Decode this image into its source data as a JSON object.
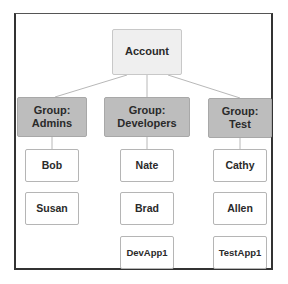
{
  "diagram": {
    "root": {
      "label": "Account"
    },
    "groups": [
      {
        "prefix": "Group:",
        "name": "Admins",
        "members": [
          "Bob",
          "Susan"
        ]
      },
      {
        "prefix": "Group:",
        "name": "Developers",
        "members": [
          "Nate",
          "Brad",
          "DevApp1"
        ]
      },
      {
        "prefix": "Group:",
        "name": "Test",
        "members": [
          "Cathy",
          "Allen",
          "TestApp1"
        ]
      }
    ],
    "colors": {
      "root_fill": "#efefef",
      "group_fill": "#bdbdbd",
      "member_fill": "#ffffff",
      "connector": "#b8b8b8",
      "frame": "#333333"
    }
  }
}
